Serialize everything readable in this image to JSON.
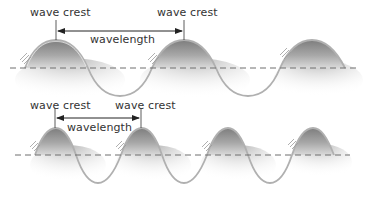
{
  "diagram": {
    "type": "wave-comparison",
    "colors": {
      "wave_line": "#b5b5b5",
      "wave_fill_dark": "#8c8c8c",
      "dashed_axis": "#6e6e6e",
      "arrow": "#222222",
      "text": "#333333"
    },
    "panels": [
      {
        "id": "long-wavelength",
        "crest_label_left": "wave crest",
        "crest_label_right": "wave crest",
        "measure_label": "wavelength",
        "crest_count": 3
      },
      {
        "id": "short-wavelength",
        "crest_label_left": "wave crest",
        "crest_label_right": "wave crest",
        "measure_label": "wavelength",
        "crest_count": 4
      }
    ]
  }
}
